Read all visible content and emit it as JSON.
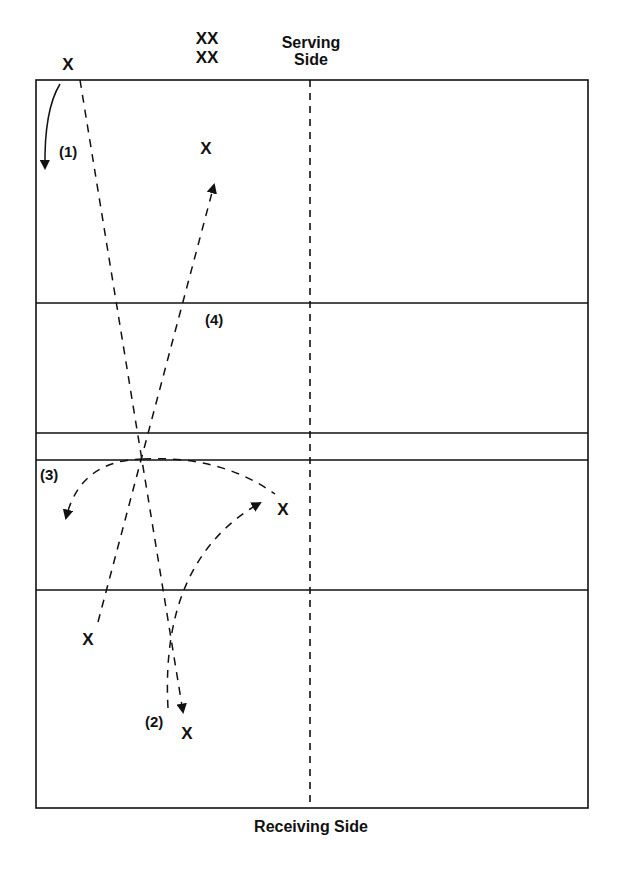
{
  "labels": {
    "serving_side_line1": "Serving",
    "serving_side_line2": "Side",
    "receiving_side": "Receiving Side",
    "step1": "(1)",
    "step2": "(2)",
    "step3": "(3)",
    "step4": "(4)"
  },
  "players": {
    "server": "X",
    "waiting_row1": "XX",
    "waiting_row2": "XX",
    "top_player": "X",
    "mid_right_player": "X",
    "bottom_left_player": "X",
    "bottom_player": "X"
  },
  "colors": {
    "line": "#111111",
    "background": "#ffffff"
  }
}
